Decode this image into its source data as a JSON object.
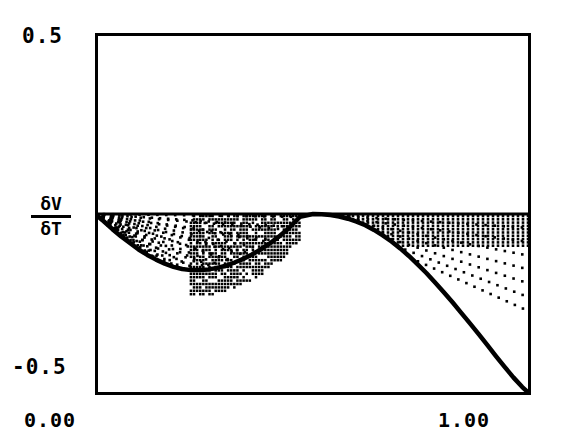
{
  "axes": {
    "y_max_label": "0.5",
    "y_min_label": "-0.5",
    "x_min_label": "0.00",
    "x_max_label": "1.00",
    "y_axis_numerator": "δV",
    "y_axis_denominator": "δT"
  },
  "chart_data": {
    "type": "line",
    "title": "",
    "xlabel": "",
    "ylabel": "δV/δT",
    "xlim": [
      0.0,
      1.0
    ],
    "ylim": [
      -0.5,
      0.5
    ],
    "xticks": [
      0.0,
      1.0
    ],
    "xticklabels": [
      "0.00",
      "1.00"
    ],
    "yticks": [
      -0.5,
      0.5
    ],
    "yticklabels": [
      "-0.5",
      "0.5"
    ],
    "grid": false,
    "legend": null,
    "frame_color": "#000000",
    "curve_color": "#000000",
    "hatch_color": "#000000",
    "zero_line_value": 0.0,
    "series": [
      {
        "name": "δV/δT",
        "x": [
          0.0,
          0.02,
          0.04,
          0.06,
          0.08,
          0.1,
          0.12,
          0.14,
          0.16,
          0.18,
          0.2,
          0.22,
          0.24,
          0.26,
          0.28,
          0.3,
          0.32,
          0.34,
          0.36,
          0.38,
          0.4,
          0.42,
          0.44,
          0.46,
          0.47,
          0.5,
          0.52,
          0.54,
          0.56,
          0.58,
          0.6,
          0.62,
          0.64,
          0.66,
          0.68,
          0.7,
          0.72,
          0.74,
          0.76,
          0.78,
          0.8,
          0.82,
          0.84,
          0.86,
          0.88,
          0.9,
          0.92,
          0.94,
          0.96,
          0.98,
          1.0
        ],
        "y": [
          0.0,
          -0.02,
          -0.042,
          -0.062,
          -0.08,
          -0.098,
          -0.113,
          -0.126,
          -0.137,
          -0.146,
          -0.152,
          -0.155,
          -0.155,
          -0.153,
          -0.149,
          -0.143,
          -0.134,
          -0.124,
          -0.112,
          -0.098,
          -0.082,
          -0.064,
          -0.044,
          -0.02,
          -0.008,
          0.0,
          -0.001,
          -0.003,
          -0.007,
          -0.013,
          -0.021,
          -0.031,
          -0.044,
          -0.059,
          -0.076,
          -0.095,
          -0.116,
          -0.139,
          -0.163,
          -0.189,
          -0.216,
          -0.244,
          -0.273,
          -0.302,
          -0.332,
          -0.362,
          -0.393,
          -0.423,
          -0.452,
          -0.478,
          -0.5
        ]
      }
    ],
    "fill_regions": [
      {
        "name": "left-lobe",
        "x_start": 0.0,
        "x_end": 0.47,
        "hatch": "diagonal-dotted",
        "between": "curve-and-zero"
      },
      {
        "name": "mid-dense-block",
        "x_start": 0.22,
        "x_end": 0.47,
        "hatch": "vertical-dotted-dense",
        "between": "curve-and-zero"
      },
      {
        "name": "right-lobe",
        "x_start": 0.5,
        "x_end": 1.0,
        "hatch": "vertical-dotted-and-diagonal-rays",
        "between": "curve-and-zero"
      }
    ]
  }
}
